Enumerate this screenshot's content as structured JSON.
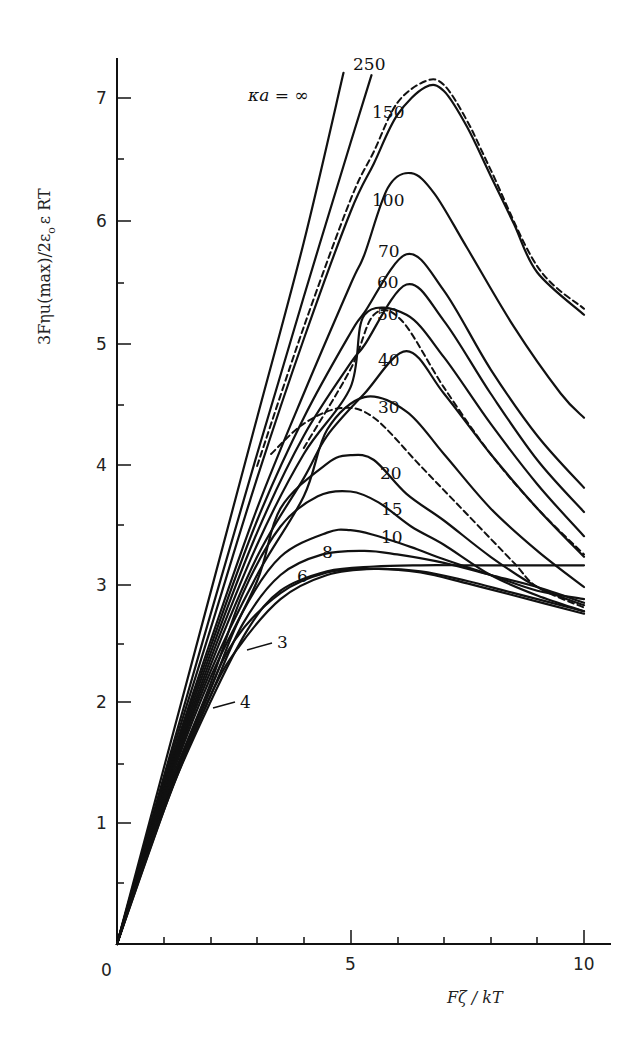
{
  "chart_data": {
    "type": "line",
    "title": "",
    "xlabel": "Fζ / kT",
    "ylabel": "3Fηu(max)/2ε₀ε RT",
    "xlim": [
      0,
      10.5
    ],
    "ylim": [
      0,
      7.3
    ],
    "grid": false,
    "legend_position": "inline curve labels",
    "x_ticks": [
      0,
      5,
      10
    ],
    "x_minor_ticks": [
      1,
      2,
      3,
      4,
      6,
      7,
      8,
      9
    ],
    "y_ticks": [
      1,
      2,
      3,
      4,
      5,
      6,
      7
    ],
    "y_minor_ticks": [
      0.5,
      1.5,
      2.5,
      3.5,
      4.5,
      5.5,
      6.5
    ],
    "origin_label": "0",
    "series_parameter": "κa",
    "series": [
      {
        "name": "κa = ∞",
        "label": "κa = ∞",
        "style": "solid",
        "points": [
          [
            0,
            0
          ],
          [
            1,
            1.45
          ],
          [
            2,
            2.9
          ],
          [
            3,
            4.35
          ],
          [
            4,
            5.8
          ],
          [
            4.85,
            7.2
          ]
        ]
      },
      {
        "name": "250",
        "label": "250",
        "style": "solid",
        "points": [
          [
            0,
            0
          ],
          [
            1,
            1.38
          ],
          [
            2,
            2.72
          ],
          [
            3,
            4.05
          ],
          [
            4,
            5.35
          ],
          [
            5,
            6.62
          ],
          [
            5.45,
            7.18
          ]
        ]
      },
      {
        "name": "150",
        "label": "150",
        "style": "solid",
        "points": [
          [
            0,
            0
          ],
          [
            1,
            1.35
          ],
          [
            2,
            2.6
          ],
          [
            3,
            3.85
          ],
          [
            4,
            5.0
          ],
          [
            5,
            6.05
          ],
          [
            5.5,
            6.45
          ],
          [
            6,
            6.85
          ],
          [
            6.6,
            7.08
          ],
          [
            7,
            7.05
          ],
          [
            7.5,
            6.75
          ],
          [
            8,
            6.35
          ],
          [
            8.5,
            5.95
          ],
          [
            9,
            5.55
          ],
          [
            10,
            5.2
          ]
        ]
      },
      {
        "name": "150 (dashed)",
        "label": "",
        "style": "dashed",
        "points": [
          [
            3,
            3.95
          ],
          [
            4,
            5.1
          ],
          [
            5,
            6.15
          ],
          [
            5.5,
            6.55
          ],
          [
            6,
            6.95
          ],
          [
            6.6,
            7.13
          ],
          [
            7,
            7.1
          ],
          [
            7.5,
            6.8
          ],
          [
            8,
            6.4
          ],
          [
            9,
            5.6
          ],
          [
            10,
            5.25
          ]
        ]
      },
      {
        "name": "100",
        "label": "100",
        "style": "solid",
        "points": [
          [
            0,
            0
          ],
          [
            1,
            1.32
          ],
          [
            2,
            2.5
          ],
          [
            3,
            3.6
          ],
          [
            4,
            4.55
          ],
          [
            5,
            5.45
          ],
          [
            5.3,
            5.7
          ],
          [
            5.8,
            6.25
          ],
          [
            6.3,
            6.37
          ],
          [
            6.8,
            6.2
          ],
          [
            7.5,
            5.75
          ],
          [
            8.5,
            5.1
          ],
          [
            9.5,
            4.55
          ],
          [
            10,
            4.35
          ]
        ]
      },
      {
        "name": "70",
        "label": "70",
        "style": "solid",
        "points": [
          [
            0,
            0
          ],
          [
            1,
            1.3
          ],
          [
            2,
            2.45
          ],
          [
            3,
            3.5
          ],
          [
            4,
            4.35
          ],
          [
            5,
            5.05
          ],
          [
            5.3,
            5.22
          ],
          [
            6.2,
            5.7
          ],
          [
            7,
            5.4
          ],
          [
            8,
            4.75
          ],
          [
            9,
            4.2
          ],
          [
            10,
            3.77
          ]
        ]
      },
      {
        "name": "60",
        "label": "60",
        "style": "solid",
        "points": [
          [
            0,
            0
          ],
          [
            1,
            1.28
          ],
          [
            2,
            2.4
          ],
          [
            3,
            3.4
          ],
          [
            4,
            4.2
          ],
          [
            5,
            4.8
          ],
          [
            5.3,
            4.95
          ],
          [
            6.2,
            5.45
          ],
          [
            7,
            5.15
          ],
          [
            8,
            4.55
          ],
          [
            9,
            4.0
          ],
          [
            10,
            3.57
          ]
        ]
      },
      {
        "name": "50",
        "label": "50",
        "style": "solid",
        "points": [
          [
            0,
            0
          ],
          [
            1,
            1.26
          ],
          [
            2,
            2.35
          ],
          [
            3,
            3.3
          ],
          [
            4,
            4.05
          ],
          [
            5,
            4.6
          ],
          [
            5.3,
            5.2
          ],
          [
            6.2,
            5.2
          ],
          [
            7,
            4.85
          ],
          [
            8,
            4.3
          ],
          [
            9,
            3.8
          ],
          [
            10,
            3.37
          ]
        ]
      },
      {
        "name": "50 (dashed)",
        "label": "",
        "style": "dashed",
        "points": [
          [
            4,
            4.1
          ],
          [
            5,
            4.75
          ],
          [
            5.5,
            5.2
          ],
          [
            6.1,
            5.15
          ],
          [
            7,
            4.6
          ],
          [
            8,
            4.05
          ],
          [
            9,
            3.6
          ],
          [
            10,
            3.22
          ]
        ]
      },
      {
        "name": "40",
        "label": "40",
        "style": "solid",
        "points": [
          [
            0,
            0
          ],
          [
            1,
            1.24
          ],
          [
            2,
            2.3
          ],
          [
            3,
            3.2
          ],
          [
            4,
            3.85
          ],
          [
            4.5,
            4.2
          ],
          [
            5.3,
            4.55
          ],
          [
            6.2,
            4.9
          ],
          [
            7,
            4.55
          ],
          [
            8,
            4.05
          ],
          [
            9,
            3.6
          ],
          [
            10,
            3.2
          ]
        ]
      },
      {
        "name": "30",
        "label": "30",
        "style": "solid",
        "points": [
          [
            0,
            0
          ],
          [
            1,
            1.22
          ],
          [
            2,
            2.25
          ],
          [
            3,
            3.05
          ],
          [
            4,
            3.7
          ],
          [
            4.5,
            4.25
          ],
          [
            5.3,
            4.52
          ],
          [
            6.2,
            4.4
          ],
          [
            7,
            4.05
          ],
          [
            8,
            3.6
          ],
          [
            9,
            3.25
          ],
          [
            10,
            2.95
          ]
        ]
      },
      {
        "name": "30 (dashed)",
        "label": "",
        "style": "dashed",
        "points": [
          [
            3.3,
            4.05
          ],
          [
            4,
            4.3
          ],
          [
            4.8,
            4.43
          ],
          [
            5.5,
            4.35
          ],
          [
            6.5,
            3.95
          ],
          [
            7.5,
            3.55
          ],
          [
            8.5,
            3.15
          ],
          [
            9,
            2.95
          ],
          [
            10,
            2.78
          ]
        ]
      },
      {
        "name": "20",
        "label": "20",
        "style": "solid",
        "points": [
          [
            0,
            0
          ],
          [
            1,
            1.2
          ],
          [
            2,
            2.2
          ],
          [
            3,
            3.0
          ],
          [
            3.5,
            3.6
          ],
          [
            4.5,
            3.97
          ],
          [
            5.0,
            4.04
          ],
          [
            5.5,
            4.0
          ],
          [
            6.2,
            3.72
          ],
          [
            7,
            3.5
          ],
          [
            8,
            3.2
          ],
          [
            9,
            2.95
          ],
          [
            10,
            2.8
          ]
        ]
      },
      {
        "name": "15",
        "label": "15",
        "style": "solid",
        "points": [
          [
            0,
            0
          ],
          [
            1,
            1.18
          ],
          [
            2,
            2.15
          ],
          [
            2.7,
            2.9
          ],
          [
            3.5,
            3.45
          ],
          [
            4.3,
            3.7
          ],
          [
            5.0,
            3.74
          ],
          [
            5.6,
            3.65
          ],
          [
            6.3,
            3.45
          ],
          [
            7,
            3.3
          ],
          [
            8,
            3.05
          ],
          [
            9,
            2.88
          ],
          [
            10,
            2.75
          ]
        ]
      },
      {
        "name": "10",
        "label": "10",
        "style": "solid",
        "points": [
          [
            0,
            0
          ],
          [
            1,
            1.16
          ],
          [
            2,
            2.1
          ],
          [
            2.7,
            2.75
          ],
          [
            3.5,
            3.2
          ],
          [
            4.5,
            3.4
          ],
          [
            5.0,
            3.42
          ],
          [
            5.5,
            3.38
          ],
          [
            6.3,
            3.28
          ],
          [
            7,
            3.18
          ],
          [
            8,
            3.05
          ],
          [
            9,
            2.92
          ],
          [
            10,
            2.85
          ]
        ]
      },
      {
        "name": "8",
        "label": "8",
        "style": "solid",
        "points": [
          [
            0,
            0
          ],
          [
            1,
            1.14
          ],
          [
            2,
            2.05
          ],
          [
            2.7,
            2.65
          ],
          [
            3.5,
            3.05
          ],
          [
            4.4,
            3.22
          ],
          [
            5.3,
            3.25
          ],
          [
            6,
            3.22
          ],
          [
            7,
            3.15
          ],
          [
            8,
            3.05
          ],
          [
            9,
            2.95
          ],
          [
            10,
            2.82
          ]
        ]
      },
      {
        "name": "6",
        "label": "6",
        "style": "solid",
        "points": [
          [
            0,
            0
          ],
          [
            1,
            1.12
          ],
          [
            2,
            2.0
          ],
          [
            2.8,
            2.6
          ],
          [
            3.5,
            2.92
          ],
          [
            4.5,
            3.08
          ],
          [
            5.5,
            3.12
          ],
          [
            6.5,
            3.13
          ],
          [
            7.5,
            3.13
          ],
          [
            8.5,
            3.13
          ],
          [
            10,
            3.13
          ]
        ]
      },
      {
        "name": "4",
        "label": "4",
        "style": "solid",
        "points": [
          [
            0,
            0
          ],
          [
            1,
            1.1
          ],
          [
            1.8,
            1.92
          ],
          [
            2.5,
            2.5
          ],
          [
            3.5,
            2.9
          ],
          [
            4.5,
            3.07
          ],
          [
            5.5,
            3.1
          ],
          [
            6.5,
            3.08
          ],
          [
            7.5,
            3.0
          ],
          [
            8.5,
            2.9
          ],
          [
            10,
            2.75
          ]
        ]
      },
      {
        "name": "3",
        "label": "3",
        "style": "solid",
        "points": [
          [
            0,
            0
          ],
          [
            1,
            1.1
          ],
          [
            2,
            2.05
          ],
          [
            2.6,
            2.45
          ],
          [
            3.5,
            2.85
          ],
          [
            4.5,
            3.05
          ],
          [
            5.5,
            3.1
          ],
          [
            6.5,
            3.07
          ],
          [
            7.5,
            2.98
          ],
          [
            8.5,
            2.88
          ],
          [
            10,
            2.73
          ]
        ]
      }
    ]
  },
  "axes": {
    "x_title": "Fζ / kT",
    "y_title": "3Fηu(max)/2ε",
    "y_title_sub": "o",
    "y_title_tail": "ε RT",
    "x_tick_labels": [
      "0",
      "5",
      "10"
    ],
    "y_tick_labels": [
      "1",
      "2",
      "3",
      "4",
      "5",
      "6",
      "7"
    ]
  },
  "labels": {
    "inf": "κa = ∞",
    "k250": "250",
    "k150": "150",
    "k100": "100",
    "k70": "70",
    "k60": "60",
    "k50": "50",
    "k40": "40",
    "k30": "30",
    "k20": "20",
    "k15": "15",
    "k10": "10",
    "k8": "8",
    "k6": "6",
    "k4": "4",
    "k3": "3"
  },
  "colors": {
    "ink": "#111111",
    "background": "#ffffff"
  }
}
